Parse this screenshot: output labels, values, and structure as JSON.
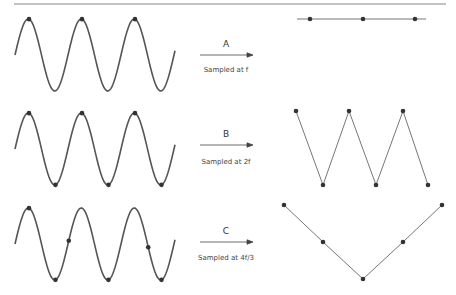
{
  "diagram": {
    "colors": {
      "line": "#555555",
      "dot": "#333333",
      "rule": "#888888"
    },
    "rows": [
      {
        "id": "A",
        "label": "A",
        "caption": "Sampled at f"
      },
      {
        "id": "B",
        "label": "B",
        "caption": "Sampled at 2f"
      },
      {
        "id": "C",
        "label": "C",
        "caption": "Sampled at 4f/3"
      }
    ]
  }
}
